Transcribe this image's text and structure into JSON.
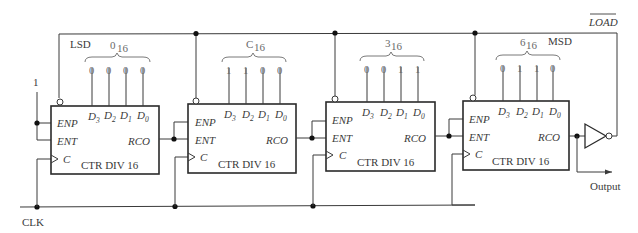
{
  "diagram": {
    "type": "circuit",
    "signals": {
      "load": "LOAD",
      "load_active_low": true,
      "clock": "CLK",
      "output": "Output",
      "enable_input": "1"
    },
    "labels": {
      "lsd": "LSD",
      "msd": "MSD"
    },
    "counters": [
      {
        "id": "ctr1",
        "name": "CTR DIV 16",
        "hex_digit": "0",
        "hex_sub": "16",
        "data_bits": [
          "0",
          "0",
          "0",
          "0"
        ],
        "pins": {
          "enp": "ENP",
          "ent": "ENT",
          "clk": "C",
          "rco": "RCO"
        },
        "data_pins": [
          {
            "base": "D",
            "sub": "3"
          },
          {
            "base": "D",
            "sub": "2"
          },
          {
            "base": "D",
            "sub": "1"
          },
          {
            "base": "D",
            "sub": "0"
          }
        ]
      },
      {
        "id": "ctr2",
        "name": "CTR DIV 16",
        "hex_digit": "C",
        "hex_sub": "16",
        "data_bits": [
          "1",
          "1",
          "0",
          "0"
        ],
        "pins": {
          "enp": "ENP",
          "ent": "ENT",
          "clk": "C",
          "rco": "RCO"
        },
        "data_pins": [
          {
            "base": "D",
            "sub": "3"
          },
          {
            "base": "D",
            "sub": "2"
          },
          {
            "base": "D",
            "sub": "1"
          },
          {
            "base": "D",
            "sub": "0"
          }
        ]
      },
      {
        "id": "ctr3",
        "name": "CTR DIV 16",
        "hex_digit": "3",
        "hex_sub": "16",
        "data_bits": [
          "0",
          "0",
          "1",
          "1"
        ],
        "pins": {
          "enp": "ENP",
          "ent": "ENT",
          "clk": "C",
          "rco": "RCO"
        },
        "data_pins": [
          {
            "base": "D",
            "sub": "3"
          },
          {
            "base": "D",
            "sub": "2"
          },
          {
            "base": "D",
            "sub": "1"
          },
          {
            "base": "D",
            "sub": "0"
          }
        ]
      },
      {
        "id": "ctr4",
        "name": "CTR DIV 16",
        "hex_digit": "6",
        "hex_sub": "16",
        "data_bits": [
          "0",
          "1",
          "1",
          "0"
        ],
        "pins": {
          "enp": "ENP",
          "ent": "ENT",
          "clk": "C",
          "rco": "RCO"
        },
        "data_pins": [
          {
            "base": "D",
            "sub": "3"
          },
          {
            "base": "D",
            "sub": "2"
          },
          {
            "base": "D",
            "sub": "1"
          },
          {
            "base": "D",
            "sub": "0"
          }
        ]
      }
    ]
  }
}
